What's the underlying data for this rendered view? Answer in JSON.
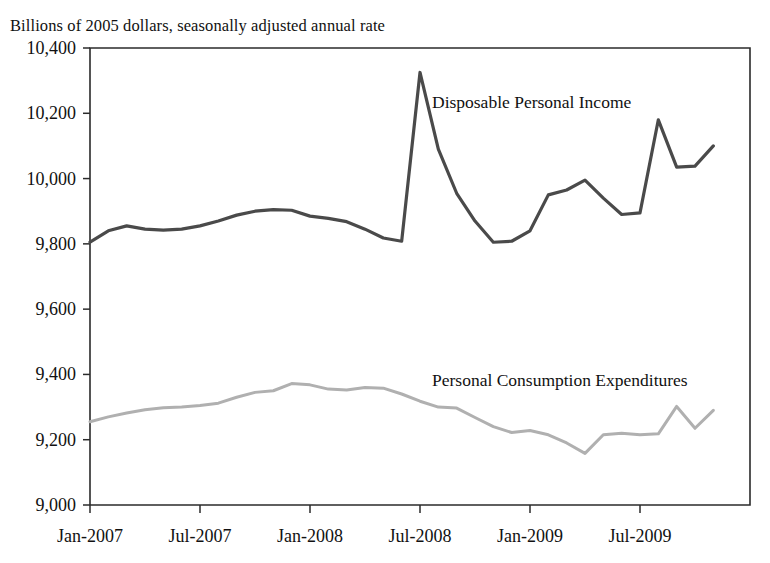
{
  "chart_data": {
    "type": "line",
    "title": "",
    "subtitle": "Billions of 2005 dollars, seasonally adjusted annual rate",
    "xlabel": "",
    "ylabel": "",
    "ylim": [
      9000,
      10400
    ],
    "ytick_values": [
      9000,
      9200,
      9400,
      9600,
      9800,
      10000,
      10200,
      10400
    ],
    "ytick_labels": [
      "9,000",
      "9,200",
      "9,400",
      "9,600",
      "9,800",
      "10,000",
      "10,200",
      "10,400"
    ],
    "xlim": [
      "Jan-2007",
      "Nov-2009"
    ],
    "xtick_labels": [
      "Jan-2007",
      "Jul-2007",
      "Jan-2008",
      "Jul-2008",
      "Jan-2009",
      "Jul-2009"
    ],
    "xtick_positions": [
      0,
      6,
      12,
      18,
      24,
      30
    ],
    "grid": false,
    "legend_position": "inline-annotation",
    "x": [
      "Jan-2007",
      "Feb-2007",
      "Mar-2007",
      "Apr-2007",
      "May-2007",
      "Jun-2007",
      "Jul-2007",
      "Aug-2007",
      "Sep-2007",
      "Oct-2007",
      "Nov-2007",
      "Dec-2007",
      "Jan-2008",
      "Feb-2008",
      "Mar-2008",
      "Apr-2008",
      "May-2008",
      "Jun-2008",
      "Jul-2008",
      "Aug-2008",
      "Sep-2008",
      "Oct-2008",
      "Nov-2008",
      "Dec-2008",
      "Jan-2009",
      "Feb-2009",
      "Mar-2009",
      "Apr-2009",
      "May-2009",
      "Jun-2009",
      "Jul-2009",
      "Aug-2009",
      "Sep-2009",
      "Oct-2009",
      "Nov-2009"
    ],
    "series": [
      {
        "name": "Disposable Personal Income",
        "color": "#4a4a4a",
        "label_x": "Jul-2008",
        "label_y": 10230,
        "values": [
          9805,
          9840,
          9855,
          9845,
          9842,
          9845,
          9855,
          9870,
          9888,
          9900,
          9905,
          9903,
          9885,
          9878,
          9868,
          9845,
          9818,
          9808,
          10325,
          10090,
          9955,
          9870,
          9805,
          9808,
          9840,
          9950,
          9965,
          9995,
          9940,
          9890,
          9895,
          10180,
          10035,
          10038,
          10100
        ]
      },
      {
        "name": "Personal Consumption Expenditures",
        "color": "#b0b0b0",
        "label_x": "Jul-2008",
        "label_y": 9380,
        "values": [
          9255,
          9270,
          9282,
          9292,
          9298,
          9300,
          9305,
          9312,
          9330,
          9345,
          9350,
          9372,
          9368,
          9355,
          9352,
          9360,
          9358,
          9340,
          9318,
          9300,
          9297,
          9268,
          9240,
          9222,
          9228,
          9215,
          9190,
          9158,
          9215,
          9220,
          9215,
          9218,
          9302,
          9235,
          9290
        ]
      }
    ]
  },
  "axes": {
    "left_label": "",
    "bottom_label": ""
  }
}
